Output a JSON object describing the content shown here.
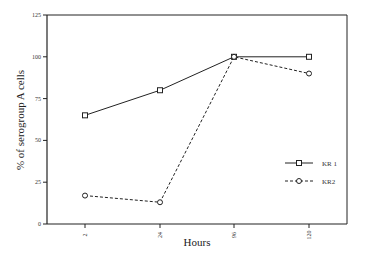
{
  "chart_data": {
    "type": "line",
    "title": "",
    "xlabel": "Hours",
    "ylabel": "% of serogroup A cells",
    "categories": [
      "2",
      "24",
      "96",
      "120"
    ],
    "ylim": [
      0,
      125
    ],
    "yticks": [
      0,
      25,
      50,
      75,
      100,
      125
    ],
    "grid": false,
    "legend_position": "lower right inside",
    "series": [
      {
        "name": "KR 1",
        "marker": "square",
        "linestyle": "solid",
        "values": [
          65,
          80,
          100,
          100
        ]
      },
      {
        "name": "KR2",
        "marker": "circle",
        "linestyle": "dashed",
        "values": [
          17,
          13,
          100,
          90
        ]
      }
    ]
  },
  "colors": {
    "line": "#222222",
    "axis": "#222222",
    "background": "#ffffff"
  }
}
